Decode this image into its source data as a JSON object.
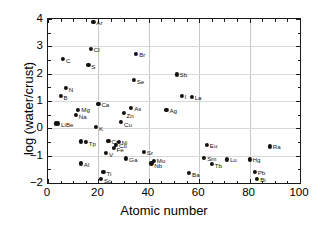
{
  "chart_data": {
    "type": "scatter",
    "title": "",
    "xlabel": "Atomic number",
    "ylabel": "log (water/crust)",
    "xlim": [
      0,
      100
    ],
    "ylim": [
      -2,
      4
    ],
    "xticks": [
      0,
      20,
      40,
      60,
      80,
      100
    ],
    "yticks": [
      -2,
      -1,
      0,
      1,
      2,
      3,
      4
    ],
    "xtick_labels": [
      "0",
      "20",
      "40",
      "60",
      "80",
      "100"
    ],
    "ytick_labels": [
      "−2",
      "−1",
      "0",
      "1",
      "2",
      "3",
      "4"
    ],
    "grid": true,
    "legend": "none",
    "marker": "filled-circle",
    "marker_color": "#111111",
    "points": [
      {
        "label": "Ar",
        "x": 18,
        "y": 3.9,
        "lx": 3,
        "ly": 0
      },
      {
        "label": "Cl",
        "x": 17,
        "y": 2.9,
        "lx": 3,
        "ly": 0
      },
      {
        "label": "C",
        "x": 6,
        "y": 2.55,
        "lx": 3,
        "ly": 1
      },
      {
        "label": "S",
        "x": 16,
        "y": 2.33,
        "lx": 3,
        "ly": 1
      },
      {
        "label": "Br",
        "x": 35,
        "y": 2.72,
        "lx": 3,
        "ly": 0
      },
      {
        "label": "Se",
        "x": 34,
        "y": 1.78,
        "lx": 3,
        "ly": 1
      },
      {
        "label": "Sb",
        "x": 51,
        "y": 1.97,
        "lx": 3,
        "ly": 0
      },
      {
        "label": "N",
        "x": 7,
        "y": 1.48,
        "lx": 3,
        "ly": 1
      },
      {
        "label": "B",
        "x": 5,
        "y": 1.18,
        "lx": 3,
        "ly": 1
      },
      {
        "label": "I",
        "x": 53,
        "y": 1.18,
        "lx": 3,
        "ly": 0
      },
      {
        "label": "La",
        "x": 57,
        "y": 1.15,
        "lx": 3,
        "ly": 0
      },
      {
        "label": "Ca",
        "x": 20,
        "y": 0.9,
        "lx": 3,
        "ly": 0
      },
      {
        "label": "Mg",
        "x": 12,
        "y": 0.68,
        "lx": 3,
        "ly": -1
      },
      {
        "label": "Na",
        "x": 11,
        "y": 0.5,
        "lx": 3,
        "ly": 1
      },
      {
        "label": "As",
        "x": 33,
        "y": 0.74,
        "lx": 3,
        "ly": 0
      },
      {
        "label": "Ag",
        "x": 47,
        "y": 0.68,
        "lx": 3,
        "ly": 0
      },
      {
        "label": "Zn",
        "x": 30,
        "y": 0.55,
        "lx": 3,
        "ly": 2
      },
      {
        "label": "Cu",
        "x": 29,
        "y": 0.25,
        "lx": 3,
        "ly": 2
      },
      {
        "label": "Li",
        "x": 3,
        "y": 0.18,
        "lx": 0,
        "ly": 0,
        "hide_label": true
      },
      {
        "label": "LiBe",
        "x": 4,
        "y": 0.18,
        "lx": 3,
        "ly": 1
      },
      {
        "label": "K",
        "x": 19,
        "y": 0.06,
        "lx": 3,
        "ly": 1
      },
      {
        "label": "T",
        "x": 13,
        "y": -0.48,
        "lx": 0,
        "ly": 0,
        "hide_label": true
      },
      {
        "label": "Tp",
        "x": 15,
        "y": -0.5,
        "lx": 3,
        "ly": 1
      },
      {
        "label": "Cr",
        "x": 24,
        "y": -0.45,
        "lx": 3,
        "ly": 0
      },
      {
        "label": "Ni",
        "x": 28,
        "y": -0.5,
        "lx": 3,
        "ly": 0
      },
      {
        "label": "Co",
        "x": 27,
        "y": -0.62,
        "lx": 3,
        "ly": 0
      },
      {
        "label": "Fe",
        "x": 26,
        "y": -0.72,
        "lx": 3,
        "ly": 1
      },
      {
        "label": "Eu",
        "x": 63,
        "y": -0.62,
        "lx": 3,
        "ly": 0
      },
      {
        "label": "Ra",
        "x": 88,
        "y": -0.66,
        "lx": 3,
        "ly": 0
      },
      {
        "label": "V",
        "x": 23,
        "y": -0.9,
        "lx": 3,
        "ly": 1
      },
      {
        "label": "Sr",
        "x": 38,
        "y": -0.85,
        "lx": 3,
        "ly": 0
      },
      {
        "label": "Sm",
        "x": 62,
        "y": -1.07,
        "lx": 3,
        "ly": 0
      },
      {
        "label": "Lu",
        "x": 71,
        "y": -1.14,
        "lx": 3,
        "ly": 0
      },
      {
        "label": "Hg",
        "x": 80,
        "y": -1.14,
        "lx": 3,
        "ly": 0
      },
      {
        "label": "Ga",
        "x": 31,
        "y": -1.1,
        "lx": 3,
        "ly": 1
      },
      {
        "label": "Mo",
        "x": 42,
        "y": -1.18,
        "lx": 3,
        "ly": -1
      },
      {
        "label": "Nb",
        "x": 41,
        "y": -1.28,
        "lx": 3,
        "ly": 2
      },
      {
        "label": "Tb",
        "x": 65,
        "y": -1.3,
        "lx": 3,
        "ly": 1
      },
      {
        "label": "Al",
        "x": 13,
        "y": -1.28,
        "lx": 3,
        "ly": 1
      },
      {
        "label": "Ti",
        "x": 22,
        "y": -1.6,
        "lx": 3,
        "ly": 1
      },
      {
        "label": "Ba",
        "x": 56,
        "y": -1.62,
        "lx": 3,
        "ly": 1
      },
      {
        "label": "Pb",
        "x": 82,
        "y": -1.58,
        "lx": 3,
        "ly": 0
      },
      {
        "label": "Sc",
        "x": 21,
        "y": -1.85,
        "lx": 3,
        "ly": 1
      },
      {
        "label": "Bi",
        "x": 83,
        "y": -1.85,
        "lx": 3,
        "ly": 0
      }
    ]
  }
}
